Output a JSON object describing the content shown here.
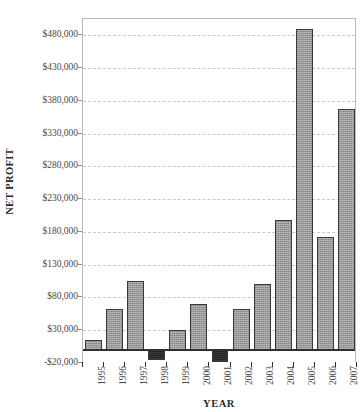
{
  "chart_data": {
    "type": "bar",
    "title": "",
    "xlabel": "YEAR",
    "ylabel": "NET PROFIT",
    "categories": [
      "1995",
      "1996",
      "1997",
      "1998",
      "1999",
      "2000",
      "2001",
      "2002",
      "2003",
      "2004",
      "2005",
      "2006",
      "2007"
    ],
    "values": [
      15000,
      62000,
      105000,
      -16000,
      31000,
      70000,
      -18000,
      62000,
      100000,
      198000,
      490000,
      172000,
      368000
    ],
    "ylim": [
      -20000,
      505000
    ],
    "ytick_values": [
      -20000,
      30000,
      80000,
      130000,
      180000,
      230000,
      280000,
      330000,
      380000,
      430000,
      480000
    ],
    "ytick_labels": [
      "-$20,000",
      "$30,000",
      "$80,000",
      "$130,000",
      "$180,000",
      "$230,000",
      "$280,000",
      "$330,000",
      "$380,000",
      "$430,000",
      "$480,000"
    ],
    "grid": true,
    "grid_axis": "y",
    "legend": false,
    "bar_fill_color": "#9a9a9a",
    "bar_negative_color": "#232323",
    "bar_border_color": "#3a3a3a",
    "gridline_color": "#c9c9c9",
    "axis_color": "#2f2f2f",
    "background_color": "#ffffff"
  }
}
